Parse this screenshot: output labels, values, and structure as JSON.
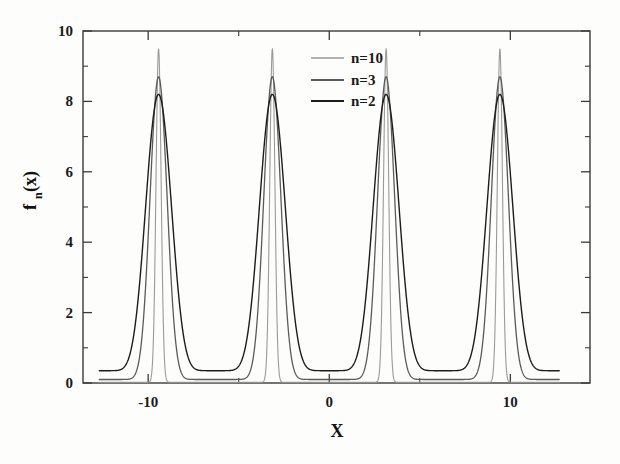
{
  "chart_data": {
    "type": "line",
    "title": "",
    "subtitle": "",
    "xlabel": "X",
    "ylabel": "f_n(x)",
    "ylabel_base": "f",
    "ylabel_sub": "n",
    "ylabel_arg": "(x)",
    "xlim": [
      -13.6,
      14.4
    ],
    "ylim": [
      0,
      10
    ],
    "x_ticks_major": [
      -10,
      0,
      10
    ],
    "x_tick_labels": [
      "-10",
      "0",
      "10"
    ],
    "x_ticks_minor": [
      -15,
      -5,
      5,
      15
    ],
    "y_ticks_major": [
      0,
      2,
      4,
      6,
      8,
      10
    ],
    "y_tick_labels": [
      "0",
      "2",
      "4",
      "6",
      "8",
      "10"
    ],
    "y_ticks_minor": [
      1,
      3,
      5,
      7,
      9
    ],
    "grid": false,
    "legend_position": "top-center-right",
    "period": 6.2832,
    "peak_centers": [
      -9.42,
      -3.14,
      3.14,
      9.42
    ],
    "domain_start": -12.7,
    "domain_end": 12.7,
    "series": [
      {
        "name": "n=10",
        "label": "n=10",
        "color": "#9a9a9a",
        "line_width": 1.1,
        "peak_value": 9.5,
        "trough_value": 0.02,
        "sharpness": 10
      },
      {
        "name": "n=3",
        "label": "n=3",
        "color": "#5a5a5a",
        "line_width": 1.3,
        "peak_value": 8.7,
        "trough_value": 0.1,
        "sharpness": 3
      },
      {
        "name": "n=2",
        "label": "n=2",
        "color": "#1c1c1c",
        "line_width": 1.4,
        "peak_value": 8.2,
        "trough_value": 0.35,
        "sharpness": 2
      }
    ]
  },
  "legend": {
    "entries": [
      {
        "label": "n=10"
      },
      {
        "label": "n=3"
      },
      {
        "label": "n=2"
      }
    ]
  },
  "axis": {
    "x_title": "X",
    "y_title_base": "f",
    "y_title_sub": "n",
    "y_title_arg": "(x)"
  },
  "colors": {
    "frame": "#3a3a3a",
    "text": "#111111",
    "background": "#fdfdfc",
    "series_n10": "#9a9a9a",
    "series_n3": "#5a5a5a",
    "series_n2": "#1c1c1c"
  }
}
